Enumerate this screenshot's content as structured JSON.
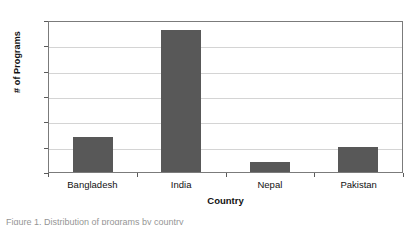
{
  "chart_data": {
    "type": "bar",
    "title": "",
    "xlabel": "Country",
    "ylabel": "# of Programs",
    "categories": [
      "Bangladesh",
      "India",
      "Nepal",
      "Pakistan"
    ],
    "values": [
      7,
      28,
      2,
      5
    ],
    "series": [
      {
        "name": "# of Programs",
        "values": [
          7,
          28,
          2,
          5
        ]
      }
    ],
    "ylim": [
      0,
      30
    ],
    "yticks": [
      "0",
      "5",
      "10",
      "15",
      "20",
      "25",
      "30"
    ],
    "ytick_values": [
      0,
      5,
      10,
      15,
      20,
      25,
      30
    ],
    "grid": "horizontal",
    "legend": "none",
    "bar_color": "#585858",
    "gridline_color": "#d4d4d4",
    "axis_color": "#7b7b7b",
    "plot_background": "#ffffff"
  },
  "caption": {
    "text": "Figure 1. Distribution of programs by country",
    "visible": "partial-clipped"
  }
}
